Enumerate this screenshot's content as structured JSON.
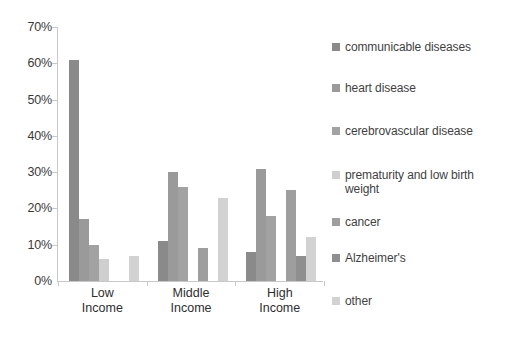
{
  "chart_data": {
    "type": "bar",
    "title": "",
    "subtitle": "",
    "xlabel": "",
    "ylabel": "",
    "categories": [
      "Low Income",
      "Middle Income",
      "High Income"
    ],
    "category_lines": [
      [
        "Low",
        "Income"
      ],
      [
        "Middle",
        "Income"
      ],
      [
        "High",
        "Income"
      ]
    ],
    "ylim": [
      0,
      70
    ],
    "ytick_labels": [
      "0%",
      "10%",
      "20%",
      "30%",
      "40%",
      "50%",
      "60%",
      "70%"
    ],
    "ytick_values": [
      0,
      10,
      20,
      30,
      40,
      50,
      60,
      70
    ],
    "grid": false,
    "legend_position": "right",
    "value_suffix": "%",
    "series": [
      {
        "name": "communicable diseases",
        "color": "#8a8a8a",
        "values": [
          61,
          11,
          8
        ]
      },
      {
        "name": "heart disease",
        "color": "#9a9a9a",
        "values": [
          17,
          30,
          31
        ]
      },
      {
        "name": "cerebrovascular disease",
        "color": "#a2a2a2",
        "values": [
          10,
          26,
          18
        ]
      },
      {
        "name": "prematurity and low birth weight",
        "color": "#cfcfcf",
        "values": [
          6,
          0,
          0
        ]
      },
      {
        "name": "cancer",
        "color": "#9e9e9e",
        "values": [
          0,
          9,
          25
        ]
      },
      {
        "name": "Alzheimer's",
        "color": "#8f8f8f",
        "values": [
          0,
          0,
          7
        ]
      },
      {
        "name": "other",
        "color": "#d2d2d2",
        "values": [
          7,
          23,
          12
        ]
      }
    ]
  },
  "legend": {
    "items": [
      {
        "label": "communicable diseases",
        "color": "#8a8a8a"
      },
      {
        "label": "heart disease",
        "color": "#9a9a9a"
      },
      {
        "label": "cerebrovascular disease",
        "color": "#a2a2a2"
      },
      {
        "label": "prematurity and low birth weight",
        "color": "#cfcfcf"
      },
      {
        "label": "cancer",
        "color": "#9e9e9e"
      },
      {
        "label": "Alzheimer's",
        "color": "#8f8f8f"
      },
      {
        "label": "other",
        "color": "#d2d2d2"
      }
    ],
    "item_tops": [
      40,
      81,
      124,
      168,
      215,
      251,
      294
    ]
  },
  "axis": {
    "line_color": "#c8c8c8",
    "label_color": "#3a3a3a"
  }
}
